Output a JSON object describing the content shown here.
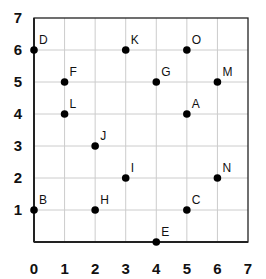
{
  "chart_data": {
    "type": "scatter",
    "title": "",
    "xlabel": "",
    "ylabel": "",
    "xlim": [
      0,
      7
    ],
    "ylim": [
      0,
      7
    ],
    "grid": true,
    "legend": null,
    "x_ticks": [
      "0",
      "1",
      "2",
      "3",
      "4",
      "5",
      "6",
      "7"
    ],
    "y_ticks": [
      "1",
      "2",
      "3",
      "4",
      "5",
      "6",
      "7"
    ],
    "points": [
      {
        "label": "A",
        "x": 5,
        "y": 4
      },
      {
        "label": "B",
        "x": 0,
        "y": 1
      },
      {
        "label": "C",
        "x": 5,
        "y": 1
      },
      {
        "label": "D",
        "x": 0,
        "y": 6
      },
      {
        "label": "E",
        "x": 4,
        "y": 0
      },
      {
        "label": "F",
        "x": 1,
        "y": 5
      },
      {
        "label": "G",
        "x": 4,
        "y": 5
      },
      {
        "label": "H",
        "x": 2,
        "y": 1
      },
      {
        "label": "I",
        "x": 3,
        "y": 2
      },
      {
        "label": "J",
        "x": 2,
        "y": 3
      },
      {
        "label": "K",
        "x": 3,
        "y": 6
      },
      {
        "label": "L",
        "x": 1,
        "y": 4
      },
      {
        "label": "M",
        "x": 6,
        "y": 5
      },
      {
        "label": "N",
        "x": 6,
        "y": 2
      },
      {
        "label": "O",
        "x": 5,
        "y": 6
      }
    ]
  },
  "colors": {
    "axis": "#222222",
    "grid": "#cccccc",
    "point": "#000000",
    "text": "#111111"
  }
}
